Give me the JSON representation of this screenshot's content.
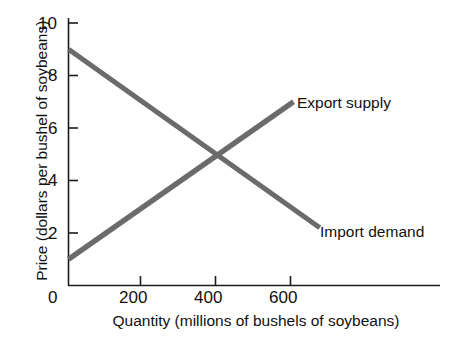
{
  "chart_data": {
    "type": "line",
    "title": "",
    "xlabel": "Quantity (millions of bushels of soybeans)",
    "ylabel": "Price (dollars per bushel of soybeans)",
    "xlim": [
      0,
      1000
    ],
    "ylim": [
      0,
      10.2
    ],
    "grid": false,
    "legend_position": "inline-right-of-line-ends",
    "xticks": [
      {
        "value": 200,
        "label": "200"
      },
      {
        "value": 400,
        "label": "400"
      },
      {
        "value": 600,
        "label": "600"
      }
    ],
    "yticks": [
      {
        "value": 2,
        "label": "2"
      },
      {
        "value": 4,
        "label": "4"
      },
      {
        "value": 6,
        "label": "6"
      },
      {
        "value": 8,
        "label": "8"
      },
      {
        "value": 10,
        "label": "10"
      }
    ],
    "origin_label": "0",
    "line_color": "#6b6b6b",
    "axis_color": "#1c1c1c",
    "background_color": "#ffffff",
    "series": [
      {
        "name": "Export supply",
        "label": "Export supply",
        "color": "#6b6b6b",
        "x": [
          0,
          600
        ],
        "y": [
          1,
          7
        ],
        "points": [
          [
            0,
            1
          ],
          [
            400,
            5
          ],
          [
            600,
            7
          ]
        ]
      },
      {
        "name": "Import demand",
        "label": "Import demand",
        "color": "#6b6b6b",
        "x": [
          0,
          670
        ],
        "y": [
          9,
          2.2
        ],
        "points": [
          [
            0,
            9
          ],
          [
            400,
            5
          ],
          [
            670,
            2.2
          ]
        ]
      }
    ],
    "annotations": [
      {
        "name": "equilibrium",
        "x": 400,
        "y": 5,
        "text": ""
      }
    ]
  }
}
